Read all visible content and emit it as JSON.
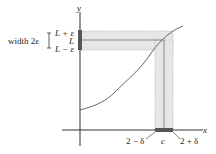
{
  "diagram": {
    "axes": {
      "x_label": "x",
      "y_label": "y"
    },
    "y_interval": {
      "width_label": "width 2ε",
      "upper_label": "L + ε",
      "center_label": "L",
      "lower_label": "L − ε"
    },
    "x_interval": {
      "left_label": "2 − δ",
      "center_label": "c",
      "right_label": "2 + δ"
    },
    "colors": {
      "band": "#e6e6e6",
      "band_border": "#bcbcbc",
      "interval_bar": "#555555",
      "curve": "#666666",
      "axis": "#333333"
    }
  }
}
